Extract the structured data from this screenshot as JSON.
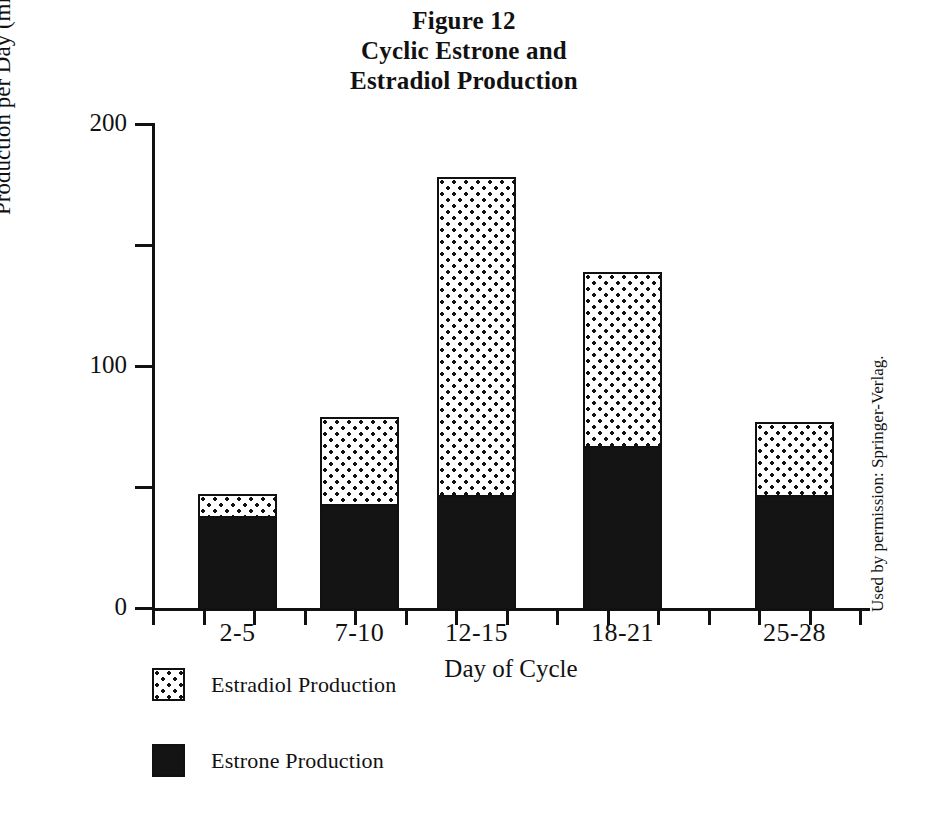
{
  "figure": {
    "title_lines": [
      "Figure 12",
      "Cyclic Estrone and",
      "Estradiol Production"
    ],
    "credit": "Used by permission: Springer-Verlag."
  },
  "chart_data": {
    "type": "bar",
    "stacked": true,
    "title": "Figure 12 Cyclic Estrone and Estradiol Production",
    "xlabel": "Day of Cycle",
    "ylabel": "Production per Day (micrograms)",
    "categories": [
      "2-5",
      "7-10",
      "12-15",
      "18-21",
      "25-28"
    ],
    "series": [
      {
        "name": "Estrone Production",
        "values": [
          37,
          42,
          46,
          66,
          46
        ]
      },
      {
        "name": "Estradiol Production",
        "values": [
          10,
          37,
          132,
          73,
          31
        ]
      }
    ],
    "totals": [
      47,
      79,
      178,
      139,
      77
    ],
    "ylim": [
      0,
      200
    ],
    "ytick_major": [
      0,
      100,
      200
    ],
    "ytick_major_labels": [
      "0",
      "100",
      "200"
    ],
    "ytick_minor": [
      50,
      150
    ],
    "grid": false,
    "legend_position": "below-left",
    "legend": [
      {
        "label": "Estradiol Production",
        "swatch": "dotted"
      },
      {
        "label": "Estrone Production",
        "swatch": "solid"
      }
    ]
  }
}
